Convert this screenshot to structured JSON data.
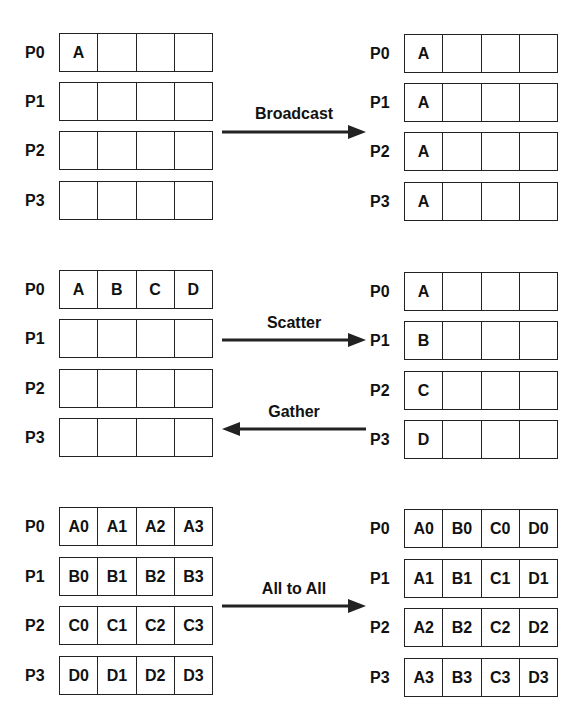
{
  "panels": [
    {
      "name": "broadcast",
      "operation": "Broadcast",
      "direction": "right",
      "before": {
        "rows": [
          {
            "label": "P0",
            "cells": [
              "A",
              "",
              "",
              ""
            ]
          },
          {
            "label": "P1",
            "cells": [
              "",
              "",
              "",
              ""
            ]
          },
          {
            "label": "P2",
            "cells": [
              "",
              "",
              "",
              ""
            ]
          },
          {
            "label": "P3",
            "cells": [
              "",
              "",
              "",
              ""
            ]
          }
        ]
      },
      "after": {
        "rows": [
          {
            "label": "P0",
            "cells": [
              "A",
              "",
              "",
              ""
            ]
          },
          {
            "label": "P1",
            "cells": [
              "A",
              "",
              "",
              ""
            ]
          },
          {
            "label": "P2",
            "cells": [
              "A",
              "",
              "",
              ""
            ]
          },
          {
            "label": "P3",
            "cells": [
              "A",
              "",
              "",
              ""
            ]
          }
        ]
      }
    },
    {
      "name": "scatter-gather",
      "operation": "Scatter",
      "operation_reverse": "Gather",
      "before": {
        "rows": [
          {
            "label": "P0",
            "cells": [
              "A",
              "B",
              "C",
              "D"
            ]
          },
          {
            "label": "P1",
            "cells": [
              "",
              "",
              "",
              ""
            ]
          },
          {
            "label": "P2",
            "cells": [
              "",
              "",
              "",
              ""
            ]
          },
          {
            "label": "P3",
            "cells": [
              "",
              "",
              "",
              ""
            ]
          }
        ]
      },
      "after": {
        "rows": [
          {
            "label": "P0",
            "cells": [
              "A",
              "",
              "",
              ""
            ]
          },
          {
            "label": "P1",
            "cells": [
              "B",
              "",
              "",
              ""
            ]
          },
          {
            "label": "P2",
            "cells": [
              "C",
              "",
              "",
              ""
            ]
          },
          {
            "label": "P3",
            "cells": [
              "D",
              "",
              "",
              ""
            ]
          }
        ]
      }
    },
    {
      "name": "all-to-all",
      "operation": "All to All",
      "direction": "right",
      "before": {
        "rows": [
          {
            "label": "P0",
            "cells": [
              "A0",
              "A1",
              "A2",
              "A3"
            ]
          },
          {
            "label": "P1",
            "cells": [
              "B0",
              "B1",
              "B2",
              "B3"
            ]
          },
          {
            "label": "P2",
            "cells": [
              "C0",
              "C1",
              "C2",
              "C3"
            ]
          },
          {
            "label": "P3",
            "cells": [
              "D0",
              "D1",
              "D2",
              "D3"
            ]
          }
        ]
      },
      "after": {
        "rows": [
          {
            "label": "P0",
            "cells": [
              "A0",
              "B0",
              "C0",
              "D0"
            ]
          },
          {
            "label": "P1",
            "cells": [
              "A1",
              "B1",
              "C1",
              "D1"
            ]
          },
          {
            "label": "P2",
            "cells": [
              "A2",
              "B2",
              "C2",
              "D2"
            ]
          },
          {
            "label": "P3",
            "cells": [
              "A3",
              "B3",
              "C3",
              "D3"
            ]
          }
        ]
      }
    }
  ],
  "colors": {
    "line": "#222222",
    "background": "#ffffff",
    "text": "#111111"
  }
}
